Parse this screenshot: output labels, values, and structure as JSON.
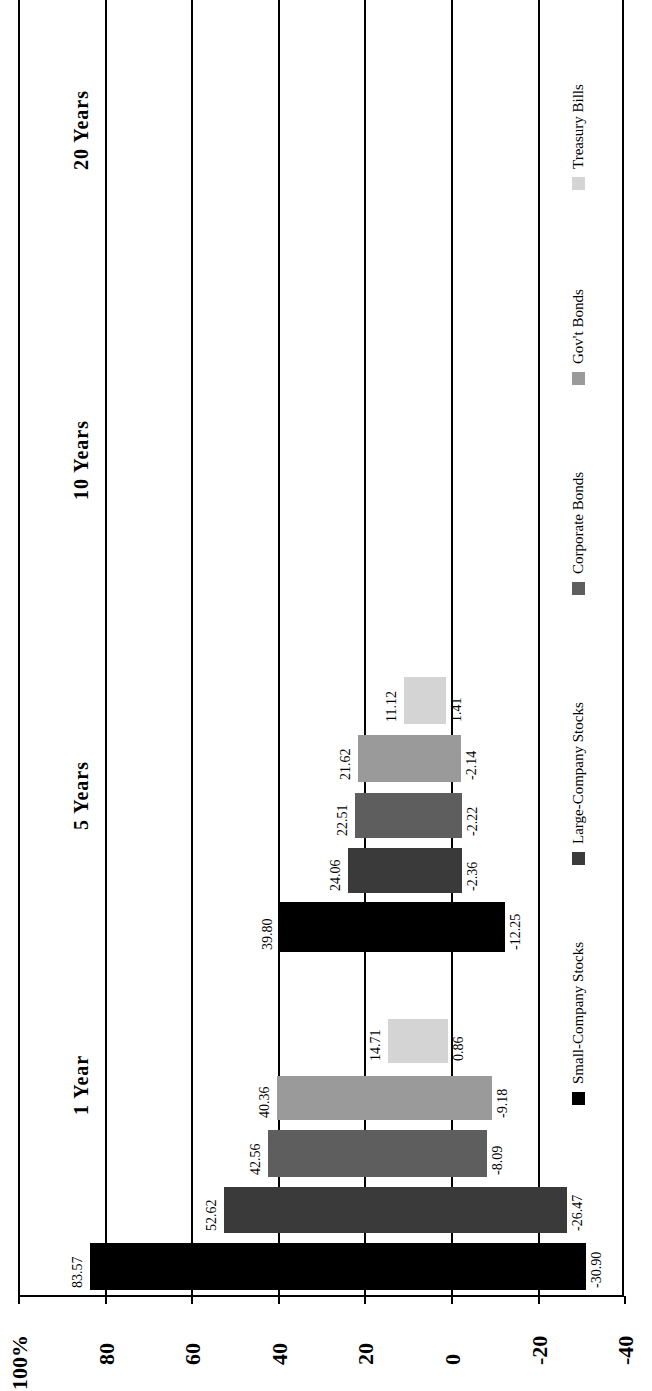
{
  "chart_data": {
    "type": "bar",
    "orientation": "rotated-90-ccw (range/floating bars)",
    "title": "",
    "ylabel": "Percent",
    "unit_label": "100%",
    "ylim": [
      -40,
      100
    ],
    "ticks": [
      "100%",
      "80",
      "60",
      "40",
      "20",
      "0",
      "-20",
      "-40"
    ],
    "tick_values": [
      100,
      80,
      60,
      40,
      20,
      0,
      -20,
      -40
    ],
    "categories": [
      "1 Year",
      "5 Years",
      "10 Years",
      "20 Years"
    ],
    "series": [
      {
        "name": "Small-Company Stocks",
        "color": "#000000",
        "max": [
          83.57,
          39.8,
          null,
          null
        ],
        "min": [
          -30.9,
          -12.25,
          null,
          null
        ]
      },
      {
        "name": "Large-Company Stocks",
        "color": "#3a3a3a",
        "max": [
          52.62,
          24.06,
          null,
          null
        ],
        "min": [
          -26.47,
          -2.36,
          null,
          null
        ]
      },
      {
        "name": "Corporate Bonds",
        "color": "#5e5e5e",
        "max": [
          42.56,
          22.51,
          null,
          null
        ],
        "min": [
          -8.09,
          -2.22,
          null,
          null
        ]
      },
      {
        "name": "Gov't Bonds",
        "color": "#9a9a9a",
        "max": [
          40.36,
          21.62,
          null,
          null
        ],
        "min": [
          -9.18,
          -2.14,
          null,
          null
        ]
      },
      {
        "name": "Treasury Bills",
        "color": "#d4d4d4",
        "max": [
          14.71,
          11.12,
          null,
          null
        ],
        "min": [
          0.86,
          1.41,
          null,
          null
        ]
      }
    ],
    "grid": true,
    "legend_position": "bottom"
  },
  "layout": {
    "zero_x": 452,
    "px_per_unit": 4.33,
    "bars": [
      {
        "cat": 0,
        "s": 0,
        "y": 1243,
        "h": 47,
        "max_label": "83.57",
        "min_label": "-30.90"
      },
      {
        "cat": 0,
        "s": 1,
        "y": 1187,
        "h": 46,
        "max_label": "52.62",
        "min_label": "-26.47"
      },
      {
        "cat": 0,
        "s": 2,
        "y": 1130,
        "h": 47,
        "max_label": "42.56",
        "min_label": "-8.09"
      },
      {
        "cat": 0,
        "s": 3,
        "y": 1076,
        "h": 44,
        "max_label": "40.36",
        "min_label": "-9.18"
      },
      {
        "cat": 0,
        "s": 4,
        "y": 1019,
        "h": 44,
        "max_label": "14.71",
        "min_label": "0.86"
      },
      {
        "cat": 1,
        "s": 0,
        "y": 902,
        "h": 50,
        "max_label": "39.80",
        "min_label": "-12.25"
      },
      {
        "cat": 1,
        "s": 1,
        "y": 848,
        "h": 45,
        "max_label": "24.06",
        "min_label": "-2.36"
      },
      {
        "cat": 1,
        "s": 2,
        "y": 793,
        "h": 45,
        "max_label": "22.51",
        "min_label": "-2.22"
      },
      {
        "cat": 1,
        "s": 3,
        "y": 735,
        "h": 47,
        "max_label": "21.62",
        "min_label": "-2.14"
      },
      {
        "cat": 1,
        "s": 4,
        "y": 677,
        "h": 47,
        "max_label": "11.12",
        "min_label": "1.41"
      }
    ],
    "headers": [
      {
        "label": "1 Year",
        "y": 1115
      },
      {
        "label": "5 Years",
        "y": 830
      },
      {
        "label": "10 Years",
        "y": 500
      },
      {
        "label": "20 Years",
        "y": 170
      }
    ],
    "legend": [
      {
        "label": "Small-Company Stocks",
        "y": 1105
      },
      {
        "label": "Large-Company Stocks",
        "y": 865
      },
      {
        "label": "Corporate Bonds",
        "y": 595
      },
      {
        "label": "Gov't Bonds",
        "y": 385
      },
      {
        "label": "Treasury Bills",
        "y": 190
      }
    ]
  }
}
